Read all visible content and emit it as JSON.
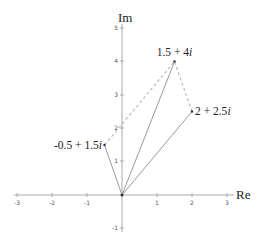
{
  "diagram": {
    "type": "complex-plane",
    "axes": {
      "x_title": "Re",
      "y_title": "Im",
      "x_ticks": [
        {
          "value": -3,
          "label": "-3"
        },
        {
          "value": -2,
          "label": "-2"
        },
        {
          "value": -1,
          "label": "-1"
        },
        {
          "value": 1,
          "label": "1"
        },
        {
          "value": 2,
          "label": "2"
        },
        {
          "value": 3,
          "label": "3"
        }
      ],
      "y_ticks": [
        {
          "value": -1,
          "label": "-1"
        },
        {
          "value": 1,
          "label": "1"
        },
        {
          "value": 2,
          "label": "2"
        },
        {
          "value": 3,
          "label": "3"
        },
        {
          "value": 4,
          "label": "4"
        },
        {
          "value": 5,
          "label": "5"
        }
      ],
      "xlim": [
        -3,
        3
      ],
      "ylim": [
        -1,
        5
      ]
    },
    "points": [
      {
        "id": "z1",
        "re": -0.5,
        "im": 1.5,
        "label": "-0.5 + 1.5i"
      },
      {
        "id": "z2",
        "re": 2,
        "im": 2.5,
        "label": "2 + 2.5i"
      },
      {
        "id": "sum",
        "re": 1.5,
        "im": 4,
        "label": "1.5 + 4i"
      }
    ],
    "vectors": [
      {
        "from": [
          0,
          0
        ],
        "to": [
          -0.5,
          1.5
        ],
        "style": "solid"
      },
      {
        "from": [
          0,
          0
        ],
        "to": [
          2,
          2.5
        ],
        "style": "solid"
      },
      {
        "from": [
          0,
          0
        ],
        "to": [
          1.5,
          4
        ],
        "style": "solid"
      },
      {
        "from": [
          -0.5,
          1.5
        ],
        "to": [
          1.5,
          4
        ],
        "style": "dashed"
      },
      {
        "from": [
          2,
          2.5
        ],
        "to": [
          1.5,
          4
        ],
        "style": "dashed"
      }
    ],
    "colors": {
      "axis": "#aaaaaa",
      "vector": "#999999",
      "dashed": "#bbbbbb",
      "text": "#222222"
    }
  }
}
